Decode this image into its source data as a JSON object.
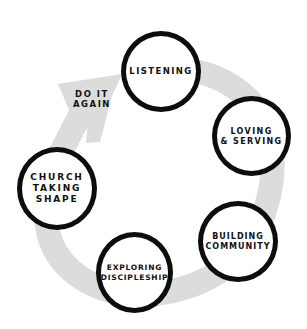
{
  "diagram": {
    "type": "cycle",
    "arrow_color": "#dcdcdc",
    "stroke_color": "#0d0d0d",
    "loop_label": "DO IT\nAGAIN",
    "nodes": [
      {
        "id": "listening",
        "label": "LISTENING"
      },
      {
        "id": "loving-serving",
        "label": "LOVING\n& SERVING"
      },
      {
        "id": "building-community",
        "label": "BUILDING\nCOMMUNITY"
      },
      {
        "id": "exploring-discipleship",
        "label": "EXPLORING\nDISCIPLESHIP"
      },
      {
        "id": "church-taking-shape",
        "label": "CHURCH\nTAKING\nSHAPE"
      }
    ],
    "flow": [
      "listening",
      "loving-serving",
      "building-community",
      "exploring-discipleship",
      "church-taking-shape",
      "listening"
    ]
  }
}
